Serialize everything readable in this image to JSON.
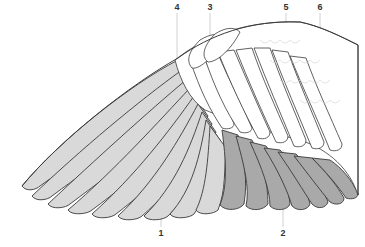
{
  "diagram": {
    "colors": {
      "primaries": "#d9d9d9",
      "secondaries": "#a9a9a9",
      "coverts": "#ffffff",
      "outline": "#3a3a3a",
      "leader": "#bdbdbd"
    },
    "labels": [
      {
        "id": "1",
        "text": "1",
        "x": 161,
        "y": 229,
        "target_x": 161,
        "target_y": 180
      },
      {
        "id": "2",
        "text": "2",
        "x": 283,
        "y": 229,
        "target_x": 283,
        "target_y": 170
      },
      {
        "id": "3",
        "text": "3",
        "x": 210,
        "y": 3,
        "target_x": 210,
        "target_y": 40
      },
      {
        "id": "4",
        "text": "4",
        "x": 177,
        "y": 3,
        "target_x": 177,
        "target_y": 55
      },
      {
        "id": "5",
        "text": "5",
        "x": 286,
        "y": 3,
        "target_x": 286,
        "target_y": 120
      },
      {
        "id": "6",
        "text": "6",
        "x": 320,
        "y": 3,
        "target_x": 320,
        "target_y": 110
      }
    ]
  }
}
